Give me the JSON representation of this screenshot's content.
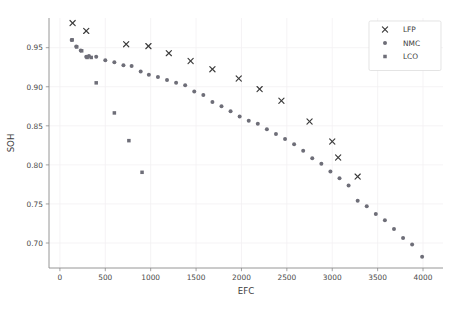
{
  "chart_data": {
    "type": "scatter",
    "title": "",
    "xlabel": "EFC",
    "ylabel": "SOH",
    "xlim": [
      -120,
      4220
    ],
    "ylim": [
      0.668,
      0.988
    ],
    "xticks": [
      0,
      500,
      1000,
      1500,
      2000,
      2500,
      3000,
      3500,
      4000
    ],
    "xtick_labels": [
      "0",
      "500",
      "1000",
      "1500",
      "2000",
      "2500",
      "3000",
      "3500",
      "4000"
    ],
    "yticks": [
      0.7,
      0.75,
      0.8,
      0.85,
      0.9,
      0.95
    ],
    "ytick_labels": [
      "0.70",
      "0.75",
      "0.80",
      "0.85",
      "0.90",
      "0.95"
    ],
    "grid": true,
    "legend_position": "upper right",
    "marker_color": "#6e6e78",
    "series": [
      {
        "name": "LFP",
        "marker": "x",
        "color": "#3a3a3a",
        "points": [
          [
            140,
            0.9815
          ],
          [
            290,
            0.9715
          ],
          [
            730,
            0.9545
          ],
          [
            975,
            0.952
          ],
          [
            1200,
            0.943
          ],
          [
            1440,
            0.933
          ],
          [
            1680,
            0.9225
          ],
          [
            1970,
            0.9105
          ],
          [
            2200,
            0.897
          ],
          [
            2440,
            0.882
          ],
          [
            2750,
            0.8555
          ],
          [
            3000,
            0.83
          ],
          [
            3065,
            0.8095
          ],
          [
            3280,
            0.785
          ]
        ]
      },
      {
        "name": "NMC",
        "marker": "o",
        "color": "#6e6e78",
        "points": [
          [
            130,
            0.96
          ],
          [
            180,
            0.9515
          ],
          [
            230,
            0.9465
          ],
          [
            290,
            0.9385
          ],
          [
            320,
            0.9395
          ],
          [
            400,
            0.9385
          ],
          [
            500,
            0.934
          ],
          [
            600,
            0.9315
          ],
          [
            700,
            0.9275
          ],
          [
            790,
            0.9265
          ],
          [
            890,
            0.9195
          ],
          [
            980,
            0.9155
          ],
          [
            1080,
            0.9125
          ],
          [
            1180,
            0.9085
          ],
          [
            1280,
            0.905
          ],
          [
            1380,
            0.902
          ],
          [
            1480,
            0.894
          ],
          [
            1580,
            0.8895
          ],
          [
            1680,
            0.8805
          ],
          [
            1780,
            0.875
          ],
          [
            1880,
            0.8685
          ],
          [
            1980,
            0.862
          ],
          [
            2080,
            0.8565
          ],
          [
            2180,
            0.8525
          ],
          [
            2280,
            0.8455
          ],
          [
            2380,
            0.8395
          ],
          [
            2480,
            0.833
          ],
          [
            2580,
            0.8265
          ],
          [
            2680,
            0.818
          ],
          [
            2780,
            0.8085
          ],
          [
            2880,
            0.8015
          ],
          [
            2980,
            0.7915
          ],
          [
            3080,
            0.783
          ],
          [
            3180,
            0.7735
          ],
          [
            3280,
            0.754
          ],
          [
            3380,
            0.747
          ],
          [
            3480,
            0.737
          ],
          [
            3580,
            0.729
          ],
          [
            3680,
            0.718
          ],
          [
            3780,
            0.7065
          ],
          [
            3880,
            0.698
          ],
          [
            3990,
            0.6825
          ]
        ]
      },
      {
        "name": "LCO",
        "marker": "s",
        "color": "#6e6e78",
        "points": [
          [
            135,
            0.96
          ],
          [
            185,
            0.951
          ],
          [
            240,
            0.946
          ],
          [
            300,
            0.9375
          ],
          [
            345,
            0.9375
          ],
          [
            400,
            0.905
          ],
          [
            600,
            0.8665
          ],
          [
            760,
            0.831
          ],
          [
            905,
            0.7905
          ]
        ]
      }
    ]
  },
  "legend": {
    "entries": [
      {
        "label": "LFP",
        "marker": "x"
      },
      {
        "label": "NMC",
        "marker": "o"
      },
      {
        "label": "LCO",
        "marker": "s"
      }
    ]
  }
}
